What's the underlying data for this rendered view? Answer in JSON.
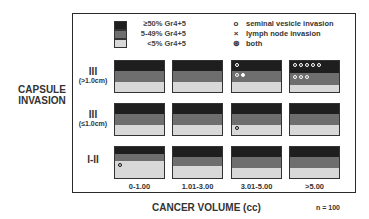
{
  "chart_data": {
    "type": "table",
    "title": "",
    "xlabel": "CANCER VOLUME (cc)",
    "ylabel": "CAPSULE INVASION",
    "n_label": "n = 100",
    "columns": [
      "0-1.00",
      "1.01-3.00",
      "3.01-5.00",
      ">5.00"
    ],
    "rows": [
      {
        "roman": "III",
        "sub": "(>1.0cm)"
      },
      {
        "roman": "III",
        "sub": "(≤1.0cm)"
      },
      {
        "roman": "I-II",
        "sub": ""
      }
    ],
    "grade_bands": [
      "≥50% Gr4+5",
      "5-49% Gr4+5",
      "<5% Gr4+5"
    ],
    "symbols": {
      "sv": "seminal vesicle invasion",
      "ln": "lymph node invasion",
      "both": "both",
      "none": "no invasion (filled dot)"
    },
    "cells": [
      [
        {
          "hi": [],
          "mid": [],
          "lo": []
        },
        {
          "hi": [],
          "mid": [],
          "lo": [
            "none"
          ]
        },
        {
          "hi": [
            "sv"
          ],
          "mid": [
            "sv",
            "both",
            "none",
            "none"
          ],
          "lo": []
        },
        {
          "hi": [
            "sv",
            "sv",
            "sv",
            "sv",
            "sv",
            "none",
            "none",
            "none",
            "none",
            "none"
          ],
          "mid": [
            "sv",
            "sv",
            "sv",
            "none",
            "none",
            "none",
            "none",
            "none",
            "none",
            "none"
          ],
          "lo": [
            "none",
            "none"
          ]
        }
      ],
      [
        {
          "hi": [],
          "mid": [],
          "lo": [
            "none"
          ]
        },
        {
          "hi": [],
          "mid": [
            "none"
          ],
          "lo": [
            "none",
            "none"
          ]
        },
        {
          "hi": [],
          "mid": [
            "none",
            "none",
            "none",
            "none",
            "none"
          ],
          "lo": [
            "sv",
            "none",
            "none"
          ]
        },
        {
          "hi": [],
          "mid": [],
          "lo": []
        }
      ],
      [
        {
          "hi": [],
          "mid": [
            "none"
          ],
          "lo": [
            "sv",
            "none",
            "none",
            "none",
            "none",
            "none",
            "none",
            "none",
            "none",
            "none",
            "none",
            "none",
            "none",
            "none",
            "none",
            "none",
            "none",
            "none",
            "none",
            "none"
          ]
        },
        {
          "hi": [],
          "mid": [
            "none",
            "none",
            "none"
          ],
          "lo": [
            "none",
            "none",
            "none",
            "none",
            "none",
            "none",
            "none",
            "none",
            "none",
            "none",
            "none",
            "none"
          ]
        },
        {
          "hi": [],
          "mid": [
            "none",
            "none",
            "none",
            "none"
          ],
          "lo": [
            "none",
            "none",
            "none"
          ]
        },
        {
          "hi": [],
          "mid": [
            "none",
            "none"
          ],
          "lo": [
            "none",
            "none"
          ]
        }
      ]
    ]
  },
  "legend": {
    "grades": [
      "≥50% Gr4+5",
      "5-49% Gr4+5",
      "<5% Gr4+5"
    ],
    "symbols": [
      {
        "glyph": "o",
        "label": "seminal vesicle invasion"
      },
      {
        "glyph": "×",
        "label": "lymph node invasion"
      },
      {
        "glyph": "⊛",
        "label": "both"
      }
    ]
  },
  "axis": {
    "left": "CAPSULE INVASION",
    "bottom": "CANCER VOLUME (cc)",
    "n": "n = 100"
  },
  "rows": [
    {
      "roman": "III",
      "sub": "(>1.0cm)"
    },
    {
      "roman": "III",
      "sub": "(≤1.0cm)"
    },
    {
      "roman": "I-II",
      "sub": ""
    }
  ],
  "columns": [
    "0-1.00",
    "1.01-3.00",
    "3.01-5.00",
    ">5.00"
  ]
}
